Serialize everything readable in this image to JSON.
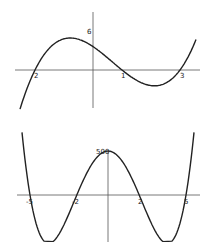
{
  "chart_data": [
    {
      "type": "line",
      "title": "",
      "function": "(x+2)(x-1)(x-3)",
      "x_intercepts": [
        -2,
        1,
        3
      ],
      "y_intercept": 6,
      "labels": {
        "x_neg2": "2",
        "x_1": "1",
        "x_3": "3",
        "y_int": "6"
      },
      "xlabel": "",
      "ylabel": "",
      "grid": false
    },
    {
      "type": "line",
      "title": "",
      "function": "5(x+5)(x+2)(x-2)(x-5)",
      "x_intercepts": [
        -5,
        -2,
        2,
        5
      ],
      "y_intercept": 500,
      "labels": {
        "x_neg5": "-5",
        "x_neg2": "-2",
        "x_2": "2",
        "x_5": "5",
        "y_int": "500"
      },
      "xlabel": "",
      "ylabel": "",
      "grid": false
    }
  ]
}
